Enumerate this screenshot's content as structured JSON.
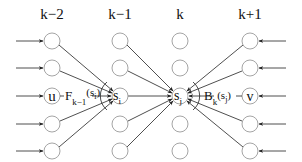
{
  "diagram": {
    "columns": [
      {
        "label": "k−2",
        "x": 52
      },
      {
        "label": "k−1",
        "x": 120
      },
      {
        "label": "k",
        "x": 180
      },
      {
        "label": "k+1",
        "x": 250
      }
    ],
    "rows_y": [
      41,
      68,
      96,
      124,
      151
    ],
    "node_radius": 8,
    "special_nodes": {
      "u": {
        "label": "u",
        "column": 0,
        "row": 2
      },
      "s_i": {
        "label": "s",
        "sub": "i",
        "column": 1,
        "row": 2
      },
      "s_j": {
        "label": "s",
        "sub": "j",
        "column": 2,
        "row": 2
      },
      "v": {
        "label": "v",
        "column": 3,
        "row": 2
      }
    },
    "edge_labels": {
      "forward": {
        "main": "F",
        "sub": "k−1",
        "arg_open": "(s",
        "arg_sub": "i",
        "arg_close": ")"
      },
      "backward": {
        "main": "B",
        "sub": "k",
        "arg_open": "(s",
        "arg_sub": "j",
        "arg_close": ")"
      }
    },
    "input_arrows": {
      "left_count": 5,
      "right_count": 5
    },
    "colors": {
      "node_stroke": "#9a9a9a",
      "edge": "#222222",
      "text": "#111111"
    }
  }
}
